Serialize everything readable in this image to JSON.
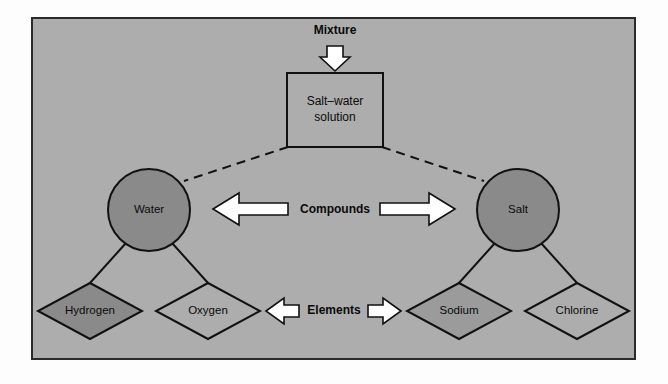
{
  "figure": {
    "panel_background": "#adadad",
    "outline_color": "#2b2b2b",
    "arrow_fill": "#ffffff",
    "shape_fill_dark": "#8a8a8a",
    "shape_fill_medium": "#9b9b9b",
    "shape_fill_none": "#adadad"
  },
  "levels": {
    "mixture": {
      "label": "Mixture",
      "arrow": "down-arrow"
    },
    "compounds": {
      "label": "Compounds",
      "left_arrow": "left-arrow",
      "right_arrow": "right-arrow"
    },
    "elements": {
      "label": "Elements",
      "left_arrow": "left-arrow",
      "right_arrow": "right-arrow"
    }
  },
  "mixture_box": {
    "label_line1": "Salt–water",
    "label_line2": "solution"
  },
  "compound_nodes": [
    {
      "label": "Water",
      "shape": "circle",
      "fill": "#8a8a8a"
    },
    {
      "label": "Salt",
      "shape": "circle",
      "fill": "#8a8a8a"
    }
  ],
  "element_nodes": [
    {
      "label": "Hydrogen",
      "shape": "diamond",
      "fill": "#8a8a8a",
      "parent": "Water"
    },
    {
      "label": "Oxygen",
      "shape": "diamond",
      "fill": "#adadad",
      "parent": "Water"
    },
    {
      "label": "Sodium",
      "shape": "diamond",
      "fill": "#9b9b9b",
      "parent": "Salt"
    },
    {
      "label": "Chlorine",
      "shape": "diamond",
      "fill": "#adadad",
      "parent": "Salt"
    }
  ],
  "connectors": {
    "mixture_to_water": "dashed",
    "mixture_to_salt": "dashed",
    "water_to_hydrogen": "solid",
    "water_to_oxygen": "solid",
    "salt_to_sodium": "solid",
    "salt_to_chlorine": "solid"
  }
}
